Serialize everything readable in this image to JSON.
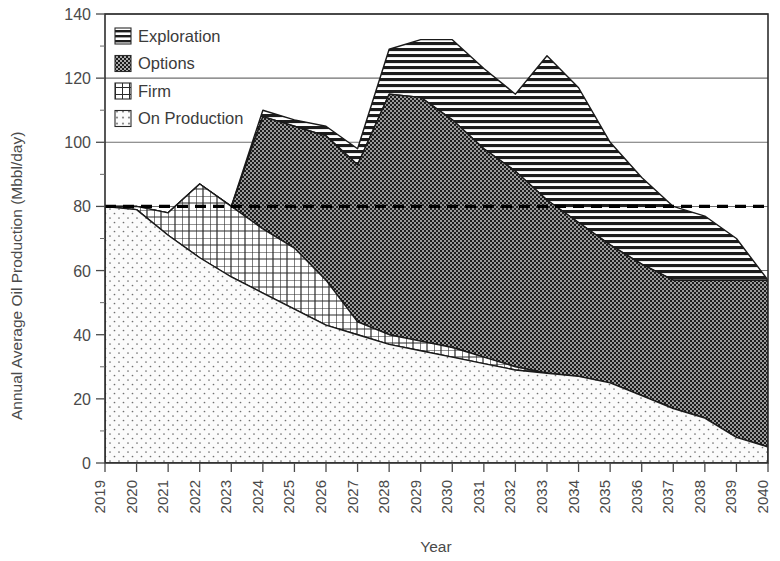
{
  "axes": {
    "ylabel": "Annual Average Oil Production (Mbbl/day)",
    "xlabel": "Year",
    "ytick_labels": [
      "0",
      "20",
      "40",
      "60",
      "80",
      "100",
      "120",
      "140"
    ],
    "xtick_labels": [
      "2019",
      "2020",
      "2021",
      "2022",
      "2023",
      "2024",
      "2025",
      "2026",
      "2027",
      "2028",
      "2029",
      "2030",
      "2031",
      "2032",
      "2033",
      "2034",
      "2035",
      "2036",
      "2037",
      "2038",
      "2039",
      "2040"
    ]
  },
  "legend": {
    "items": [
      {
        "label": "Exploration",
        "pattern": "horizontal-lines",
        "swatch": "exploration-swatch"
      },
      {
        "label": "Options",
        "pattern": "dense-checker",
        "swatch": "options-swatch"
      },
      {
        "label": "Firm",
        "pattern": "crosshatch",
        "swatch": "firm-swatch"
      },
      {
        "label": "On Production",
        "pattern": "sparse-dots",
        "swatch": "on-production-swatch"
      }
    ]
  },
  "colors": {
    "ink": "#1a1a1a",
    "text": "#4a4a4a",
    "grid": "#6f6f6f",
    "options_fill": "#3a3a3a",
    "exploration_fill": "#ffffff",
    "firm_fill": "#ffffff",
    "on_production_fill": "#fafafa",
    "reference_line": "#000000"
  },
  "chart_data": {
    "type": "area",
    "stacked": true,
    "title": "",
    "xlabel": "Year",
    "ylabel": "Annual Average Oil Production (Mbbl/day)",
    "xlim": [
      2019,
      2040
    ],
    "ylim": [
      0,
      140
    ],
    "ytick_interval": 20,
    "yminor_tick_interval": 10,
    "grid": "horizontal-major",
    "legend_position": "top-left-inside",
    "x": [
      2019,
      2020,
      2021,
      2022,
      2023,
      2024,
      2025,
      2026,
      2027,
      2028,
      2029,
      2030,
      2031,
      2032,
      2033,
      2034,
      2035,
      2036,
      2037,
      2038,
      2039,
      2040
    ],
    "series": [
      {
        "name": "On Production",
        "order": 1,
        "values": [
          80,
          79,
          71,
          64,
          58,
          53,
          48,
          43,
          40,
          37,
          35,
          33,
          31,
          29,
          28,
          27,
          25,
          21,
          17,
          14,
          8,
          5
        ]
      },
      {
        "name": "Firm",
        "order": 2,
        "values": [
          0,
          1,
          7,
          23,
          22,
          20,
          19,
          14,
          4,
          3,
          3,
          3,
          2,
          1,
          0,
          0,
          0,
          0,
          0,
          0,
          0,
          0
        ]
      },
      {
        "name": "Options",
        "order": 3,
        "values": [
          0,
          0,
          0,
          0,
          0,
          35,
          38,
          45,
          49,
          75,
          76,
          71,
          65,
          61,
          54,
          48,
          43,
          41,
          40,
          43,
          49,
          52
        ]
      },
      {
        "name": "Exploration",
        "order": 4,
        "values": [
          0,
          0,
          0,
          0,
          0,
          2,
          2,
          3,
          5,
          14,
          18,
          25,
          25,
          24,
          45,
          42,
          32,
          27,
          23,
          20,
          13,
          0
        ]
      }
    ],
    "cumulative_top": {
      "on_production": [
        80,
        79,
        71,
        64,
        58,
        53,
        48,
        43,
        40,
        37,
        35,
        33,
        31,
        29,
        28,
        27,
        25,
        21,
        17,
        14,
        8,
        5
      ],
      "firm": [
        80,
        80,
        78,
        87,
        80,
        73,
        67,
        57,
        44,
        40,
        38,
        36,
        33,
        30,
        28,
        27,
        25,
        21,
        17,
        14,
        8,
        5
      ],
      "options": [
        80,
        80,
        78,
        87,
        80,
        108,
        105,
        102,
        93,
        115,
        114,
        107,
        98,
        91,
        82,
        75,
        68,
        62,
        57,
        57,
        57,
        57
      ],
      "exploration": [
        80,
        80,
        78,
        87,
        80,
        110,
        107,
        105,
        98,
        129,
        132,
        132,
        123,
        115,
        127,
        117,
        100,
        89,
        80,
        77,
        70,
        57
      ]
    },
    "reference_line": {
      "label": "",
      "y": 80,
      "style": "dashed",
      "x_from": 2019,
      "x_to": 2040
    }
  }
}
